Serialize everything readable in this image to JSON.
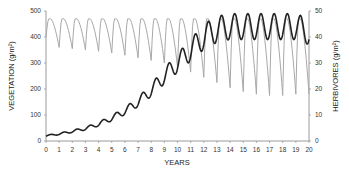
{
  "chart_data": {
    "type": "line",
    "title": "",
    "xlabel": "YEARS",
    "ylabel_left": "VEGETATION (g/m²)",
    "ylabel_right": "HERBIVORES (g/m²)",
    "xlim": [
      0,
      20
    ],
    "ylim_left": [
      0,
      500
    ],
    "ylim_right": [
      0,
      50
    ],
    "x_ticks": [
      "0",
      "1",
      "2",
      "3",
      "4",
      "5",
      "6",
      "7",
      "8",
      "9",
      "10",
      "11",
      "12",
      "13",
      "14",
      "15",
      "16",
      "17",
      "18",
      "19",
      "20"
    ],
    "y_ticks_left": [
      "0",
      "100",
      "200",
      "300",
      "400",
      "500"
    ],
    "y_ticks_right": [
      "0",
      "10",
      "20",
      "30",
      "40",
      "50"
    ],
    "grid": false,
    "legend": "none",
    "series": [
      {
        "name": "Vegetation",
        "axis": "left",
        "color": "#a8a8a8",
        "style": "thin gray, annual sawtooth oscillation",
        "peaks_per_year": 1,
        "peak_values": [
          470,
          470,
          470,
          470,
          470,
          470,
          470,
          470,
          470,
          470,
          470,
          470,
          470,
          470,
          470,
          470,
          470,
          470,
          470,
          470
        ],
        "trough_values": [
          360,
          355,
          350,
          345,
          338,
          330,
          320,
          310,
          300,
          285,
          265,
          245,
          225,
          205,
          190,
          180,
          175,
          175,
          180,
          180
        ]
      },
      {
        "name": "Herbivores",
        "axis": "right",
        "color": "#222222",
        "style": "thick black, rising with annual oscillation then stabilizing",
        "x": [
          0,
          1,
          2,
          3,
          4,
          5,
          6,
          7,
          8,
          9,
          10,
          11,
          12,
          13,
          14,
          15,
          16,
          17,
          18,
          19,
          20
        ],
        "values": [
          2,
          2.7,
          3.7,
          4.8,
          6.5,
          8.8,
          11.5,
          15,
          19.5,
          25,
          30,
          35,
          40,
          43,
          44,
          44,
          44,
          44,
          44,
          44,
          42
        ],
        "late_oscillation_range": [
          38,
          48
        ]
      }
    ]
  }
}
